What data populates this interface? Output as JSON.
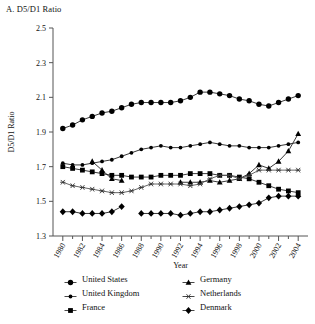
{
  "panel": {
    "title": "A. D5/D1 Ratio"
  },
  "axes": {
    "ylabel": "D5/D1 Ratio",
    "xlabel": "Year",
    "yticks": [
      "1.3",
      "1.5",
      "1.7",
      "1.9",
      "2.1",
      "2.3",
      "2.5"
    ],
    "xticks": [
      "1980",
      "1982",
      "1984",
      "1986",
      "1988",
      "1990",
      "1992",
      "1994",
      "1996",
      "1998",
      "2000",
      "2002",
      "2004"
    ]
  },
  "legend": {
    "entries": [
      {
        "label": "United States",
        "marker": "circle-marker",
        "column": "left"
      },
      {
        "label": "Germany",
        "marker": "triangle-marker",
        "column": "right"
      },
      {
        "label": "United Kingdom",
        "marker": "small-circle-marker",
        "column": "left"
      },
      {
        "label": "Netherlands",
        "marker": "asterisk-marker",
        "column": "right"
      },
      {
        "label": "France",
        "marker": "square-marker",
        "column": "left"
      },
      {
        "label": "Denmark",
        "marker": "diamond-marker",
        "column": "right"
      }
    ]
  },
  "chart_data": {
    "type": "line",
    "title": "A. D5/D1 Ratio",
    "xlabel": "Year",
    "ylabel": "D5/D1 Ratio",
    "xlim": [
      1979,
      2005
    ],
    "ylim": [
      1.3,
      2.5
    ],
    "ytick_step": 0.2,
    "xtick_step": 2,
    "grid": false,
    "legend_position": "bottom",
    "x": [
      1980,
      1981,
      1982,
      1983,
      1984,
      1985,
      1986,
      1987,
      1988,
      1989,
      1990,
      1991,
      1992,
      1993,
      1994,
      1995,
      1996,
      1997,
      1998,
      1999,
      2000,
      2001,
      2002,
      2003,
      2004
    ],
    "series": [
      {
        "name": "United States",
        "marker": "circle",
        "values": [
          1.92,
          1.94,
          1.97,
          1.99,
          2.01,
          2.02,
          2.04,
          2.06,
          2.07,
          2.07,
          2.07,
          2.07,
          2.08,
          2.1,
          2.13,
          2.13,
          2.12,
          2.11,
          2.09,
          2.08,
          2.06,
          2.05,
          2.07,
          2.09,
          2.11
        ]
      },
      {
        "name": "United Kingdom",
        "marker": "small-circle",
        "values": [
          1.72,
          1.71,
          1.71,
          1.72,
          1.73,
          1.74,
          1.76,
          1.78,
          1.8,
          1.81,
          1.82,
          1.81,
          1.81,
          1.82,
          1.83,
          1.84,
          1.83,
          1.82,
          1.82,
          1.81,
          1.81,
          1.81,
          1.82,
          1.83,
          1.84
        ]
      },
      {
        "name": "France",
        "marker": "square",
        "values": [
          1.7,
          1.69,
          1.68,
          1.67,
          1.66,
          1.65,
          1.65,
          1.64,
          1.64,
          1.64,
          1.65,
          1.65,
          1.65,
          1.66,
          1.66,
          1.66,
          1.65,
          1.65,
          1.64,
          1.63,
          1.61,
          1.59,
          1.57,
          1.56,
          1.55
        ]
      },
      {
        "name": "Germany",
        "marker": "triangle",
        "values": [
          null,
          null,
          null,
          1.73,
          1.68,
          1.63,
          1.62,
          null,
          null,
          null,
          null,
          null,
          1.61,
          1.61,
          1.61,
          1.62,
          1.61,
          1.62,
          1.63,
          1.66,
          1.71,
          1.69,
          1.73,
          1.79,
          1.89
        ]
      },
      {
        "name": "Netherlands",
        "marker": "asterisk",
        "values": [
          1.61,
          1.59,
          1.58,
          1.57,
          1.56,
          1.55,
          1.55,
          1.56,
          1.58,
          1.6,
          1.6,
          1.6,
          1.6,
          1.59,
          1.6,
          1.63,
          1.65,
          1.65,
          1.63,
          1.65,
          1.68,
          1.68,
          1.68,
          1.68,
          1.68
        ]
      },
      {
        "name": "Denmark",
        "marker": "diamond",
        "values": [
          1.44,
          1.44,
          1.43,
          1.43,
          1.43,
          1.44,
          1.47,
          null,
          1.43,
          1.43,
          1.43,
          1.43,
          1.42,
          1.43,
          1.44,
          1.44,
          1.45,
          1.46,
          1.47,
          1.48,
          1.49,
          1.52,
          1.53,
          1.53,
          1.53
        ]
      }
    ]
  }
}
